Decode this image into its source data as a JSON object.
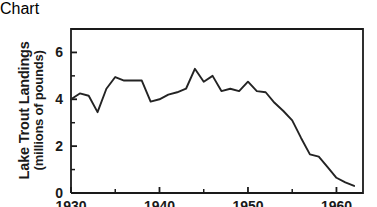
{
  "chart_data": {
    "type": "line",
    "title": "",
    "xlabel": "",
    "ylabel": "Lake Trout Landings (millions of pounds)",
    "ylabel_line1": "Lake Trout Landings",
    "ylabel_line2": "(millions of pounds)",
    "xlim": [
      1930,
      1963
    ],
    "ylim": [
      0,
      7
    ],
    "grid": false,
    "legend": null,
    "x_major_ticks": [
      1930,
      1940,
      1950,
      1960
    ],
    "x_major_tick_labels": [
      "1930",
      "1940",
      "1950",
      "1960"
    ],
    "x_minor_ticks": [
      1935,
      1945,
      1955
    ],
    "y_major_ticks": [
      0,
      2,
      4,
      6
    ],
    "y_major_tick_labels": [
      "0",
      "2",
      "4",
      "6"
    ],
    "y_minor_ticks": [
      1,
      3,
      5
    ],
    "line_color": "#232323",
    "x": [
      1930,
      1931,
      1932,
      1933,
      1934,
      1935,
      1936,
      1937,
      1938,
      1939,
      1940,
      1941,
      1942,
      1943,
      1944,
      1945,
      1946,
      1947,
      1948,
      1949,
      1950,
      1951,
      1952,
      1953,
      1954,
      1955,
      1956,
      1957,
      1958,
      1959,
      1960,
      1961,
      1962
    ],
    "values": [
      4.0,
      4.25,
      4.15,
      3.45,
      4.45,
      4.95,
      4.8,
      4.8,
      4.8,
      3.9,
      4.0,
      4.2,
      4.3,
      4.45,
      5.3,
      4.75,
      5.0,
      4.35,
      4.45,
      4.35,
      4.75,
      4.35,
      4.3,
      3.85,
      3.5,
      3.1,
      2.35,
      1.65,
      1.55,
      1.1,
      0.65,
      0.45,
      0.3
    ],
    "series": [
      {
        "name": "Lake Trout Landings",
        "values": [
          4.0,
          4.25,
          4.15,
          3.45,
          4.45,
          4.95,
          4.8,
          4.8,
          4.8,
          3.9,
          4.0,
          4.2,
          4.3,
          4.45,
          5.3,
          4.75,
          5.0,
          4.35,
          4.45,
          4.35,
          4.75,
          4.35,
          4.3,
          3.85,
          3.5,
          3.1,
          2.35,
          1.65,
          1.55,
          1.1,
          0.65,
          0.45,
          0.3
        ]
      }
    ]
  }
}
